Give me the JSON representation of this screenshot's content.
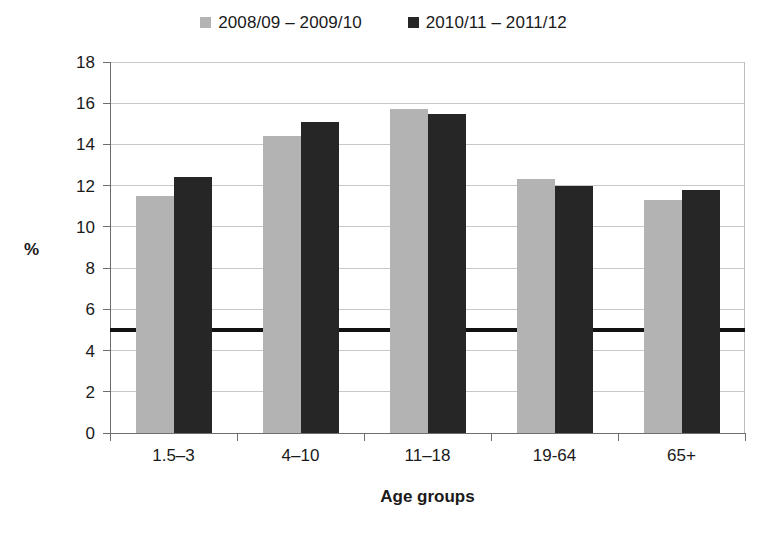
{
  "chart_data": {
    "type": "bar",
    "title": "",
    "subtitle": "",
    "xlabel": "Age groups",
    "ylabel": "%",
    "categories": [
      "1.5–3",
      "4–10",
      "11–18",
      "19-64",
      "65+"
    ],
    "series": [
      {
        "name": "2008/09 – 2009/10",
        "color": "#b3b3b3",
        "values": [
          11.5,
          14.4,
          15.7,
          12.3,
          11.3
        ]
      },
      {
        "name": "2010/11 – 2011/12",
        "color": "#262626",
        "values": [
          12.4,
          15.1,
          15.5,
          12.0,
          11.8
        ]
      }
    ],
    "ylim": [
      0,
      18
    ],
    "ytick_step": 2,
    "yticks": [
      "0",
      "2",
      "4",
      "6",
      "8",
      "10",
      "12",
      "14",
      "16",
      "18"
    ],
    "grid": true,
    "grid_axis": "y",
    "grid_color": "#c8c8c8",
    "legend_position": "top-center",
    "reference_line": {
      "value": 5,
      "color": "#111111",
      "width_px": 4
    },
    "annotations": []
  },
  "legend": {
    "entries": [
      {
        "label": "2008/09 – 2009/10",
        "swatch_name": "legend-swatch-series-a"
      },
      {
        "label": "2010/11 – 2011/12",
        "swatch_name": "legend-swatch-series-b"
      }
    ]
  },
  "axes": {
    "y_title": "%",
    "x_title": "Age groups"
  }
}
